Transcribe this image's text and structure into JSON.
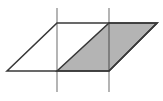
{
  "figure": {
    "canvas": {
      "width": "163",
      "height": "101",
      "viewbox": "0 0 163 101"
    },
    "colors": {
      "background": "#ffffff",
      "outline": "#383838",
      "grid_line": "#000000",
      "grid_line_opacity": "0.42",
      "shaded_fill": "#b4b4b4"
    },
    "shapes": {
      "vertical_line_left": {
        "d": "M 57 8 L 57 92"
      },
      "vertical_line_right": {
        "d": "M 109 8 L 109 92"
      },
      "outer_parallelogram": {
        "points": "7,71 57,23 157,23 109,71"
      },
      "shaded_parallelogram": {
        "points": "57,71 109,23 157,23 109,71"
      }
    }
  }
}
